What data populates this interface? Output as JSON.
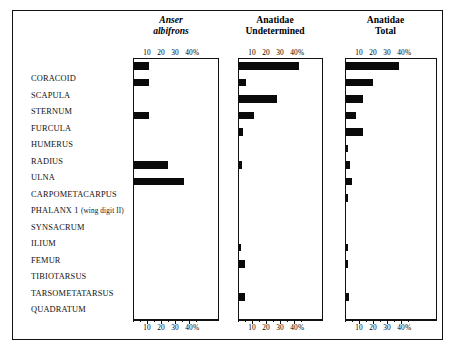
{
  "chart_data": {
    "type": "bar",
    "title": "",
    "orientation": "horizontal",
    "xlabel": "%",
    "ylabel": "",
    "xlim": [
      0,
      46
    ],
    "grid": false,
    "legend": "none",
    "axis_ticks": [
      {
        "value": 10,
        "label": "10"
      },
      {
        "value": 20,
        "label": "20"
      },
      {
        "value": 30,
        "label": "30"
      },
      {
        "value": 40,
        "label": "40"
      },
      {
        "value": 45,
        "label": "%"
      }
    ],
    "minor_tick_step": 5,
    "categories": [
      "CORACOID",
      "SCAPULA",
      "STERNUM",
      "FURCULA",
      "HUMERUS",
      "RADIUS",
      "ULNA",
      "CARPOMETACARPUS",
      "PHALANX 1(wing digit II)",
      "SYNSACRUM",
      "ILIUM",
      "FEMUR",
      "TIBIOTARSUS",
      "TARSOMETATARSUS",
      "QUADRATUM"
    ],
    "series": [
      {
        "name": "Anser albifrons",
        "name_line1": "Anser",
        "name_line2": "albifrons",
        "italic": true,
        "values": [
          11,
          11,
          0,
          11,
          0,
          0,
          24,
          36,
          0,
          0,
          0,
          0,
          0,
          0,
          0
        ]
      },
      {
        "name": "Anatidae Undetermined",
        "name_line1": "Anatidae",
        "name_line2": "Undetermined",
        "italic": false,
        "values": [
          43,
          5,
          27,
          11,
          3,
          0,
          2,
          0,
          0,
          0,
          0,
          1,
          4,
          0,
          4
        ]
      },
      {
        "name": "Anatidae Total",
        "name_line1": "Anatidae",
        "name_line2": "Total",
        "italic": false,
        "values": [
          38,
          19,
          12,
          7,
          12,
          1,
          3,
          4,
          1,
          0,
          0,
          1,
          1.5,
          0,
          2
        ]
      }
    ]
  },
  "colors": {
    "bar": "#0a0a0a",
    "frame": "#111111",
    "background": "#ffffff"
  }
}
